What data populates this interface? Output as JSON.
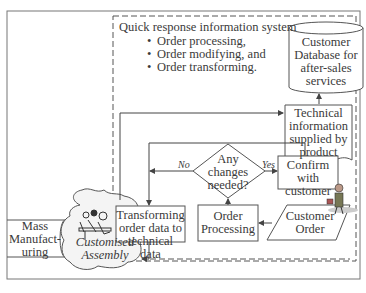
{
  "diagram": {
    "system": {
      "title": "Quick response information system",
      "bullets": [
        "Order processing,",
        "Order modifying, and",
        "Order transforming."
      ]
    },
    "nodes": {
      "database": {
        "lines": [
          "Customer",
          "Database for",
          "after-sales",
          "services"
        ],
        "shape": "cylinder"
      },
      "technical_info": {
        "lines": [
          "Technical",
          "information",
          "supplied by",
          "product"
        ],
        "shape": "document"
      },
      "decision": {
        "lines": [
          "Any",
          "changes",
          "needed?"
        ],
        "shape": "diamond"
      },
      "confirm": {
        "lines": [
          "Confirm",
          "with",
          "customer"
        ],
        "shape": "rectangle"
      },
      "order_processing": {
        "lines": [
          "Order",
          "Processing"
        ],
        "shape": "rectangle"
      },
      "customer_order": {
        "lines": [
          "Customer",
          "Order"
        ],
        "shape": "parallelogram"
      },
      "transforming": {
        "lines": [
          "Transforming",
          "order data to",
          "technical data"
        ],
        "shape": "rectangle"
      },
      "customised_assembly": {
        "lines": [
          "Customised",
          "Assembly"
        ],
        "shape": "cloud"
      },
      "mass_manufacturing": {
        "lines": [
          "Mass",
          "Manufact-",
          "uring"
        ],
        "shape": "pipe"
      }
    },
    "edge_labels": {
      "no": "No",
      "yes": "Yes"
    },
    "colors": {
      "line": "#555555",
      "text": "#3a3a3a",
      "cloud_fill": "#f4f4f4",
      "background": "#ffffff"
    }
  }
}
